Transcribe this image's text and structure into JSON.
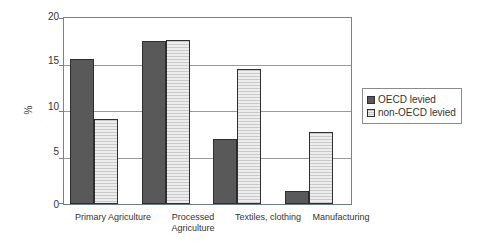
{
  "chart_data": {
    "type": "bar",
    "title": "",
    "subtitle": "",
    "xlabel": "",
    "ylabel": "%",
    "ylim": [
      0,
      20
    ],
    "yticks": [
      0,
      5,
      10,
      15,
      20
    ],
    "ytick_labels": [
      "0",
      "5",
      "10",
      "15",
      "20"
    ],
    "grid": true,
    "legend_position": "right",
    "categories": [
      "Primary Agriculture",
      "Processed\nAgriculture",
      "Textiles, clothing",
      "Manufacturing"
    ],
    "series": [
      {
        "name": "OECD levied",
        "color": "#595959",
        "pattern": "solid",
        "values": [
          15.6,
          17.5,
          7.0,
          1.4
        ]
      },
      {
        "name": "non-OECD levied",
        "color": "#d9d9d9",
        "pattern": "horizontal-lines",
        "values": [
          9.1,
          17.6,
          14.5,
          7.7
        ]
      }
    ]
  },
  "legend": {
    "items": [
      {
        "label": "OECD levied",
        "swatch": "oecd"
      },
      {
        "label": "non-OECD levied",
        "swatch": "nonoecd"
      }
    ]
  },
  "axis": {
    "y_label": "%",
    "tick_20": "20",
    "tick_15": "15",
    "tick_10": "10",
    "tick_5": "5",
    "tick_0": "0"
  },
  "categories_display": {
    "c0": "Primary Agriculture",
    "c1": "Processed\nAgriculture",
    "c2": "Textiles, clothing",
    "c3": "Manufacturing"
  }
}
